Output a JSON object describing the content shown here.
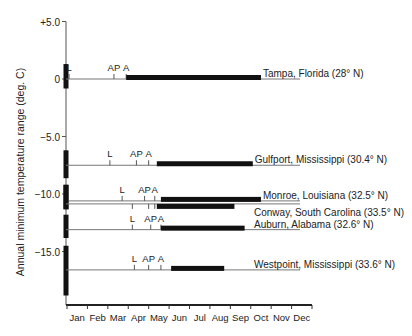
{
  "chart_data": {
    "type": "range-timeline",
    "title": "",
    "ylabel": "Annual minimum temperature range (deg. C)",
    "xlabel": "",
    "yticks": [
      {
        "value": 5.0,
        "label": "+5.0"
      },
      {
        "value": 0.0,
        "label": "0"
      },
      {
        "value": -5.0,
        "label": "-5.0"
      },
      {
        "value": -10.0,
        "label": "-10.0"
      },
      {
        "value": -15.0,
        "label": "-15.0"
      }
    ],
    "ylim": [
      -19.5,
      5.0
    ],
    "months": [
      "Jan",
      "Feb",
      "Mar",
      "Apr",
      "May",
      "Jun",
      "Jul",
      "Aug",
      "Sep",
      "Oct",
      "Nov",
      "Dec"
    ],
    "marker_legend": {
      "L": "L",
      "AP": "AP",
      "A": "A"
    },
    "series": [
      {
        "name": "Tampa, Florida (28° N)",
        "y": 0.0,
        "temp_range": [
          -1.0,
          1.3
        ],
        "markers": [
          {
            "label": "L",
            "month": 0.1
          },
          {
            "label": "AP",
            "month": 2.3
          },
          {
            "label": "A",
            "month": 2.9
          }
        ],
        "bar": [
          2.9,
          9.5
        ]
      },
      {
        "name": "Gulfport, Mississippi (30.4° N)",
        "y": -7.5,
        "temp_range": [
          -8.8,
          -6.2
        ],
        "markers": [
          {
            "label": "L",
            "month": 2.1
          },
          {
            "label": "AP",
            "month": 3.4
          },
          {
            "label": "A",
            "month": 4.0
          }
        ],
        "bar": [
          4.4,
          9.1
        ]
      },
      {
        "name": "Monroe, Louisiana (32.5° N)",
        "y": -10.6,
        "temp_range": [
          -11.5,
          -9.2
        ],
        "markers": [
          {
            "label": "L",
            "month": 2.7
          },
          {
            "label": "AP",
            "month": 3.8
          },
          {
            "label": "A",
            "month": 4.3
          }
        ],
        "bar": [
          4.6,
          9.5
        ],
        "bar_side": "upper"
      },
      {
        "name": "Conway, South Carolina (33.5° N)",
        "y": -10.6,
        "temp_range": [
          -11.5,
          -9.2
        ],
        "markers": [
          {
            "label": "",
            "month": 3.2
          },
          {
            "label": "",
            "month": 4.0
          },
          {
            "label": "",
            "month": 4.3
          }
        ],
        "bar": [
          4.4,
          8.2
        ],
        "bar_side": "lower"
      },
      {
        "name": "Auburn, Alabama (32.6° N)",
        "y": -13.1,
        "temp_range": [
          -14.0,
          -11.8
        ],
        "markers": [
          {
            "label": "L",
            "month": 3.2
          },
          {
            "label": "AP",
            "month": 4.1
          },
          {
            "label": "A",
            "month": 4.6
          }
        ],
        "bar": [
          4.6,
          8.7
        ]
      },
      {
        "name": "Westpoint, Mississippi (33.6° N)",
        "y": -16.6,
        "temp_range": [
          -19.0,
          -14.5
        ],
        "markers": [
          {
            "label": "L",
            "month": 3.3
          },
          {
            "label": "AP",
            "month": 4.0
          },
          {
            "label": "A",
            "month": 4.6
          }
        ],
        "bar": [
          5.1,
          7.7
        ]
      }
    ],
    "grid": false,
    "legend": "inline labels at right end of each series"
  }
}
